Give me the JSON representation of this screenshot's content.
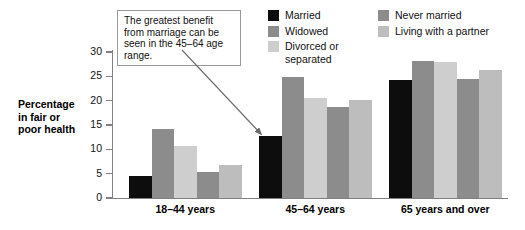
{
  "chart_data": {
    "type": "bar",
    "title": "",
    "xlabel": "",
    "ylabel": "Percentage in fair or poor health",
    "ylim": [
      0,
      30
    ],
    "yticks": [
      0,
      5,
      10,
      15,
      20,
      25,
      30
    ],
    "grid": false,
    "legend_position": "top-right",
    "categories": [
      "18–44 years",
      "45–64 years",
      "65 years and over"
    ],
    "series": [
      {
        "name": "Married",
        "color": "#0d0d0d",
        "values": [
          4.6,
          12.8,
          24.2
        ]
      },
      {
        "name": "Widowed",
        "color": "#8c8c8c",
        "values": [
          14.1,
          24.8,
          28.2
        ]
      },
      {
        "name": "Divorced or separated",
        "color": "#cecece",
        "values": [
          10.6,
          20.5,
          27.9
        ]
      },
      {
        "name": "Never married",
        "color": "#8c8c8c",
        "values": [
          5.3,
          18.7,
          24.4
        ]
      },
      {
        "name": "Living with a partner",
        "color": "#bdbdbd",
        "values": [
          6.8,
          20.1,
          26.4
        ]
      }
    ],
    "annotations": [
      {
        "text": "The greatest benefit from marriage can be seen in the 45–64 age range.",
        "points_to": "Married bar in 45–64 years group"
      }
    ]
  },
  "axis": {
    "y_title_lines": [
      "Percentage",
      "in fair or",
      "poor health"
    ],
    "y_tick_labels": [
      "0",
      "5",
      "10",
      "15",
      "20",
      "25",
      "30"
    ]
  },
  "legend": {
    "left_column": [
      {
        "label": "Married",
        "color": "#0d0d0d"
      },
      {
        "label": "Widowed",
        "color": "#8c8c8c"
      },
      {
        "label": "Divorced or\nseparated",
        "color": "#cecece"
      }
    ],
    "right_column": [
      {
        "label": "Never married",
        "color": "#8c8c8c"
      },
      {
        "label": "Living with a partner",
        "color": "#bdbdbd"
      }
    ]
  },
  "callout": {
    "text": "The greatest benefit from marriage can be seen in the 45–64 age range."
  },
  "colors": {
    "axis": "#808080",
    "text": "#111111",
    "callout_border": "#9a9a9a",
    "arrow": "#6b6b6b",
    "background": "#ffffff"
  }
}
